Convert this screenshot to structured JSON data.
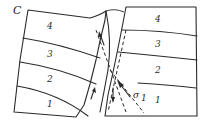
{
  "figure": {
    "panel_label": "C",
    "left_block": {
      "layers": [
        {
          "label": "4"
        },
        {
          "label": "3"
        },
        {
          "label": "2"
        },
        {
          "label": "1"
        }
      ]
    },
    "right_block": {
      "layers": [
        {
          "label": "4"
        },
        {
          "label": "3"
        },
        {
          "label": "2"
        },
        {
          "label": "1"
        }
      ]
    },
    "stress_label": "σ1",
    "stress_symbol": "σ",
    "stress_subscript": "1",
    "line_color": "#2a2a2a",
    "background": "#ffffff"
  }
}
